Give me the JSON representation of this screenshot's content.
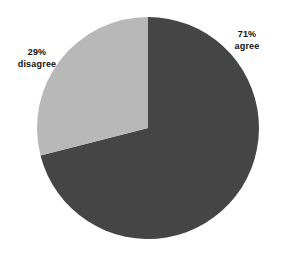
{
  "chart_data": {
    "type": "pie",
    "title": "",
    "subtitle": "",
    "xlabel": "",
    "ylabel": "",
    "grid": false,
    "legend_position": "none",
    "labels_position": "outside",
    "total": 100,
    "units": "percent",
    "categories": [
      "agree",
      "disagree"
    ],
    "values": [
      71,
      29
    ],
    "slices": [
      {
        "name": "agree",
        "value": 71,
        "value_label": "71%",
        "color": "#454545",
        "start_angle_deg": 0,
        "end_angle_deg": 255.6
      },
      {
        "name": "disagree",
        "value": 29,
        "value_label": "29%",
        "color": "#b8b8b8",
        "start_angle_deg": 255.6,
        "end_angle_deg": 360
      }
    ],
    "annotations": [
      {
        "id": "agree",
        "value_text": "71%",
        "name_text": "agree"
      },
      {
        "id": "disagree",
        "value_text": "29%",
        "name_text": "disagree"
      }
    ],
    "colors": {
      "background": "#ffffff",
      "agree": "#454545",
      "disagree": "#b8b8b8",
      "label_text": "#101010"
    }
  }
}
